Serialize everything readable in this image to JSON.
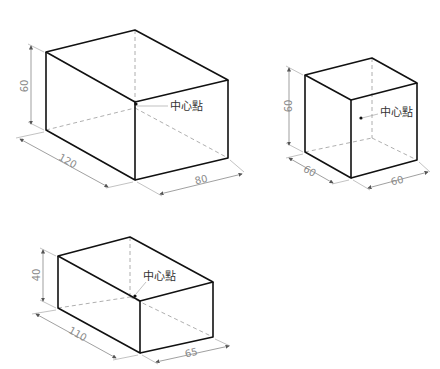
{
  "boxes": [
    {
      "id": "box-large",
      "dimensions": {
        "height": "60",
        "length": "120",
        "width": "80"
      },
      "center_label": "中心點"
    },
    {
      "id": "box-cube",
      "dimensions": {
        "height": "60",
        "length": "60",
        "width": "60"
      },
      "center_label": "中心點"
    },
    {
      "id": "box-flat",
      "dimensions": {
        "height": "40",
        "length": "110",
        "width": "65"
      },
      "center_label": "中心點"
    }
  ],
  "colors": {
    "edge": "#111111",
    "hidden": "#9a9a9a",
    "dimension": "#8a8a8a",
    "background": "#ffffff"
  }
}
